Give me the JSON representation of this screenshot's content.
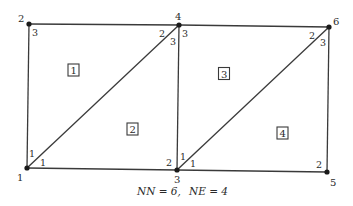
{
  "diagram": {
    "type": "finite-element-mesh",
    "caption": {
      "nn_label": "NN = 6,",
      "ne_label": "NE = 4"
    },
    "colors": {
      "line": "#3a3a3a",
      "node": "#1a1a1a",
      "text": "#2a2a2a",
      "background": "#ffffff"
    },
    "nodes": [
      {
        "id": "1",
        "x": 27,
        "y": 168
      },
      {
        "id": "2",
        "x": 29,
        "y": 24
      },
      {
        "id": "3",
        "x": 177,
        "y": 170
      },
      {
        "id": "4",
        "x": 179,
        "y": 25
      },
      {
        "id": "5",
        "x": 327,
        "y": 172
      },
      {
        "id": "6",
        "x": 329,
        "y": 27
      }
    ],
    "elements": [
      {
        "id": "1",
        "nodes": [
          "1",
          "4",
          "2"
        ],
        "local_numbers": [
          "1",
          "2",
          "3"
        ]
      },
      {
        "id": "2",
        "nodes": [
          "1",
          "3",
          "4"
        ],
        "local_numbers": [
          "1",
          "2",
          "3"
        ]
      },
      {
        "id": "3",
        "nodes": [
          "3",
          "6",
          "4"
        ],
        "local_numbers": [
          "1",
          "2",
          "3"
        ]
      },
      {
        "id": "4",
        "nodes": [
          "3",
          "5",
          "6"
        ],
        "local_numbers": [
          "1",
          "2",
          "3"
        ]
      }
    ],
    "global_labels": [
      "1",
      "2",
      "3",
      "4",
      "5",
      "6"
    ],
    "element_labels": [
      "1",
      "2",
      "3",
      "4"
    ],
    "local_labels": {
      "e1": {
        "at_n1": "1",
        "at_n4": "2",
        "at_n2": "3"
      },
      "e2": {
        "at_n1": "1",
        "at_n3": "2",
        "at_n4": "3"
      },
      "e3": {
        "at_n3": "1",
        "at_n6": "2",
        "at_n4": "3"
      },
      "e4": {
        "at_n3": "1",
        "at_n5": "2",
        "at_n6": "3"
      }
    }
  }
}
